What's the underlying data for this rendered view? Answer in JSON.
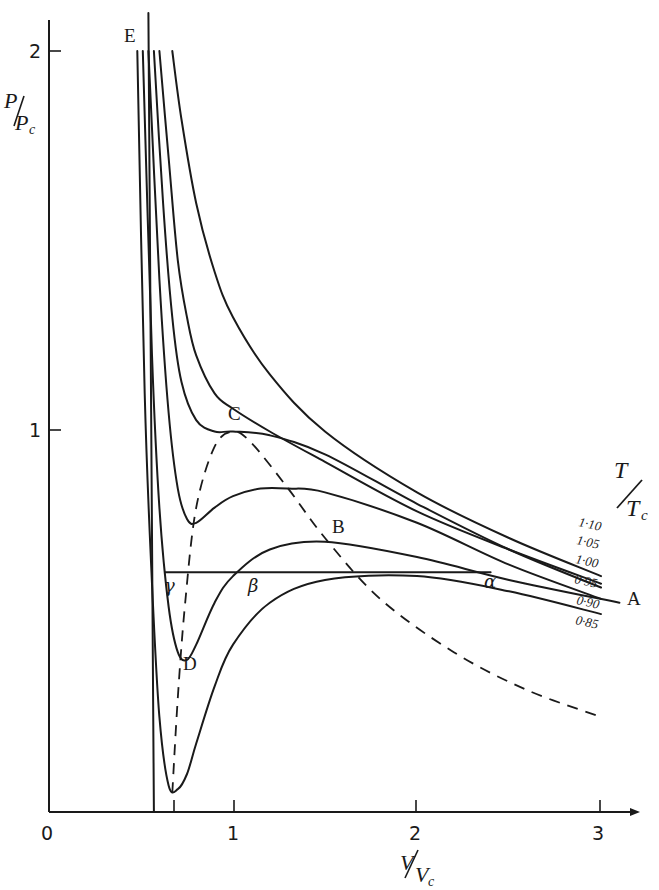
{
  "chart_data": {
    "type": "line",
    "title": "",
    "xlabel": "V/Vc",
    "ylabel": "P/Pc",
    "xlim": [
      0,
      3.2
    ],
    "ylim": [
      0,
      2.1
    ],
    "grid": false,
    "legend_title": "T/Tc",
    "legend_position": "right, at curve ends",
    "x_ticks": [
      "0",
      "1",
      "2",
      "3"
    ],
    "y_ticks": [
      "1",
      "2"
    ],
    "series": [
      {
        "name": "1·10",
        "x": [
          0.67,
          0.72,
          0.8,
          0.9,
          1.0,
          1.2,
          1.5,
          2.0,
          2.5,
          3.0
        ],
        "y": [
          2.0,
          1.82,
          1.6,
          1.42,
          1.3,
          1.15,
          1.0,
          0.84,
          0.72,
          0.62
        ]
      },
      {
        "name": "1·05",
        "x": [
          0.6,
          0.65,
          0.7,
          0.75,
          0.8,
          0.9,
          1.0,
          1.2,
          1.5,
          2.0,
          2.5,
          3.0
        ],
        "y": [
          2.0,
          1.72,
          1.45,
          1.3,
          1.2,
          1.1,
          1.06,
          1.0,
          0.92,
          0.79,
          0.69,
          0.6
        ]
      },
      {
        "name": "1·00",
        "x": [
          0.57,
          0.62,
          0.67,
          0.72,
          0.8,
          0.9,
          1.0,
          1.2,
          1.5,
          2.0,
          2.5,
          3.0
        ],
        "y": [
          2.0,
          1.6,
          1.3,
          1.13,
          1.03,
          1.0,
          1.0,
          0.99,
          0.94,
          0.81,
          0.69,
          0.59
        ]
      },
      {
        "name": "0·95",
        "x": [
          0.54,
          0.6,
          0.65,
          0.7,
          0.75,
          0.8,
          0.9,
          1.0,
          1.15,
          1.3,
          1.5,
          2.0,
          2.5,
          3.0
        ],
        "y": [
          2.0,
          1.4,
          1.05,
          0.85,
          0.77,
          0.76,
          0.8,
          0.83,
          0.85,
          0.85,
          0.84,
          0.76,
          0.65,
          0.56
        ]
      },
      {
        "name": "0·90",
        "x": [
          0.51,
          0.56,
          0.6,
          0.65,
          0.7,
          0.75,
          0.8,
          0.9,
          1.0,
          1.2,
          1.5,
          2.0,
          2.5,
          3.1
        ],
        "y": [
          2.0,
          1.2,
          0.8,
          0.54,
          0.42,
          0.4,
          0.44,
          0.55,
          0.62,
          0.69,
          0.71,
          0.67,
          0.61,
          0.55
        ]
      },
      {
        "name": "0·85",
        "x": [
          0.48,
          0.52,
          0.56,
          0.6,
          0.65,
          0.7,
          0.75,
          0.8,
          0.9,
          1.0,
          1.2,
          1.5,
          2.0,
          2.5,
          3.0
        ],
        "y": [
          2.0,
          1.1,
          0.6,
          0.25,
          0.07,
          0.06,
          0.1,
          0.18,
          0.33,
          0.44,
          0.55,
          0.61,
          0.62,
          0.58,
          0.52
        ]
      }
    ],
    "isotherm_E": {
      "x": [
        0.54,
        0.57
      ],
      "y": [
        2.1,
        0.0
      ],
      "label": "E"
    },
    "coexistence_line": {
      "x": [
        0.63,
        2.4
      ],
      "y": [
        0.63,
        0.63
      ],
      "labels": [
        "γ",
        "β",
        "α"
      ]
    },
    "spinodal_dashed": {
      "x": [
        0.67,
        0.7,
        0.74,
        0.8,
        0.9,
        1.0,
        1.1,
        1.3,
        1.5,
        1.8,
        2.2,
        2.6,
        3.0
      ],
      "y": [
        0.05,
        0.3,
        0.55,
        0.8,
        0.96,
        1.0,
        0.97,
        0.85,
        0.72,
        0.56,
        0.42,
        0.32,
        0.25
      ]
    },
    "annotations": [
      {
        "text": "E",
        "x": 0.5,
        "y": 2.03
      },
      {
        "text": "C",
        "x": 1.0,
        "y": 1.04
      },
      {
        "text": "B",
        "x": 1.45,
        "y": 0.74
      },
      {
        "text": "D",
        "x": 0.75,
        "y": 0.36
      },
      {
        "text": "A",
        "x": 3.15,
        "y": 0.56
      },
      {
        "text": "γ",
        "x": 0.64,
        "y": 0.58
      },
      {
        "text": "β",
        "x": 1.04,
        "y": 0.58
      },
      {
        "text": "α",
        "x": 2.35,
        "y": 0.6
      }
    ]
  },
  "axes": {
    "y_label_num": "P",
    "y_label_den": "P",
    "y_label_sub": "c",
    "x_label_num": "V",
    "x_label_den": "V",
    "x_label_sub": "c",
    "legend_num": "T",
    "legend_den": "T",
    "legend_sub": "c",
    "x_tick_labels": [
      "0",
      "1",
      "2",
      "3"
    ],
    "y_tick_labels": [
      "1",
      "2"
    ]
  },
  "point_labels": {
    "E": "E",
    "C": "C",
    "B": "B",
    "D": "D",
    "A": "A",
    "gamma": "γ",
    "beta": "β",
    "alpha": "α"
  },
  "curve_labels": [
    "1·10",
    "1·05",
    "1·00",
    "0·95",
    "0·90",
    "0·85"
  ]
}
